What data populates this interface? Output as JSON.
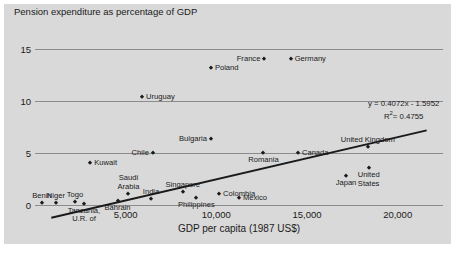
{
  "chart_data": {
    "type": "scatter",
    "title": "Pension expenditure as percentage of GDP",
    "xlabel": "GDP per capita (1987 US$)",
    "ylabel": "",
    "xlim": [
      0,
      22500
    ],
    "ylim": [
      0,
      16.2
    ],
    "xticks": [
      "5,000",
      "10,000",
      "15,000",
      "20,000"
    ],
    "xtick_values": [
      5000,
      10000,
      15000,
      20000
    ],
    "yticks": [
      "0",
      "5",
      "10",
      "15"
    ],
    "ytick_values": [
      0,
      5,
      10,
      15
    ],
    "grid": "horizontal",
    "legend": "none",
    "trendline": {
      "equation": "y = 0.4072x - 1.5952",
      "r_squared": "R",
      "r_squared_sup": "2",
      "r_squared_value": "= 0.4755",
      "slope": 0.4072,
      "intercept": -1.5952,
      "x_units": "thousands of 1987 US$"
    },
    "points": [
      {
        "name": "Benin",
        "x": 380,
        "y": 0.15,
        "label_pos": "t"
      },
      {
        "name": "Niger",
        "x": 1150,
        "y": 0.15,
        "label_pos": "t"
      },
      {
        "name": "Togo",
        "x": 2200,
        "y": 0.25,
        "label_pos": "t"
      },
      {
        "name": "Tanzania, U.R. of",
        "x": 2700,
        "y": 0.1,
        "label_pos": "b"
      },
      {
        "name": "Bahrain",
        "x": 4550,
        "y": 0.35,
        "label_pos": "b"
      },
      {
        "name": "Saudi Arabia",
        "x": 5150,
        "y": 1.05,
        "label_pos": "t"
      },
      {
        "name": "India",
        "x": 6400,
        "y": 0.55,
        "label_pos": "t"
      },
      {
        "name": "Kuwait",
        "x": 3050,
        "y": 4.05,
        "label_pos": "r"
      },
      {
        "name": "Singapore",
        "x": 8150,
        "y": 1.25,
        "label_pos": "t"
      },
      {
        "name": "Philippines",
        "x": 8900,
        "y": 0.7,
        "label_pos": "b"
      },
      {
        "name": "Colombia",
        "x": 10150,
        "y": 1.1,
        "label_pos": "r"
      },
      {
        "name": "Mexico",
        "x": 11250,
        "y": 0.65,
        "label_pos": "r"
      },
      {
        "name": "Chile",
        "x": 6500,
        "y": 5.05,
        "label_pos": "l"
      },
      {
        "name": "Bulgaria",
        "x": 9700,
        "y": 6.35,
        "label_pos": "l"
      },
      {
        "name": "Romania",
        "x": 12600,
        "y": 5.0,
        "label_pos": "b"
      },
      {
        "name": "Canada",
        "x": 14500,
        "y": 5.05,
        "label_pos": "r"
      },
      {
        "name": "Japan",
        "x": 17150,
        "y": 2.75,
        "label_pos": "b"
      },
      {
        "name": "United Kingdom",
        "x": 18350,
        "y": 5.55,
        "label_pos": "t"
      },
      {
        "name": "United States",
        "x": 18400,
        "y": 3.55,
        "label_pos": "b"
      },
      {
        "name": "Uruguay",
        "x": 5900,
        "y": 10.45,
        "label_pos": "r"
      },
      {
        "name": "Poland",
        "x": 9700,
        "y": 13.25,
        "label_pos": "r"
      },
      {
        "name": "France",
        "x": 12650,
        "y": 14.05,
        "label_pos": "l"
      },
      {
        "name": "Germany",
        "x": 14100,
        "y": 14.05,
        "label_pos": "r"
      }
    ]
  }
}
